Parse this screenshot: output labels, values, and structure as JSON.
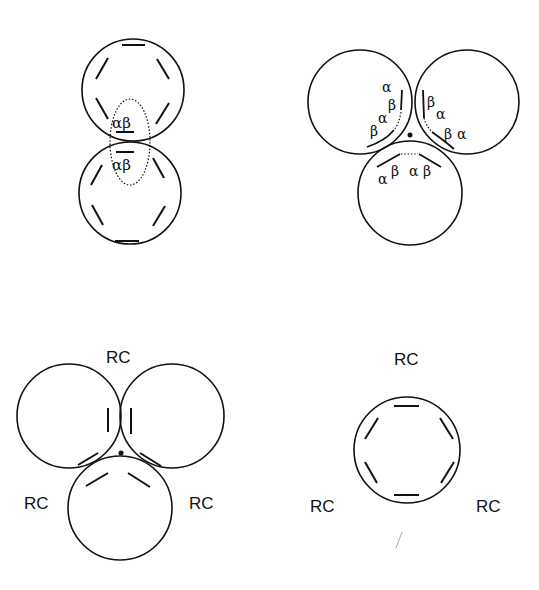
{
  "panels": {
    "dimer": {
      "name": "two-ring stacked dimer",
      "ellipse_label_top": "αβ",
      "ellipse_label_bottom": "αβ"
    },
    "trimer": {
      "name": "three-ring trimer with subunit labels",
      "left_labels": [
        "α",
        "β",
        "α",
        "β"
      ],
      "right_labels": [
        "β",
        "α",
        "β",
        "α"
      ],
      "bottom_labels": [
        "α",
        "β",
        "α",
        "β"
      ]
    },
    "rc_trimer": {
      "name": "three-ring trimer with reaction centers",
      "labels": {
        "top": "RC",
        "left": "RC",
        "right": "RC"
      }
    },
    "rc_ring": {
      "name": "single ring with reaction centers",
      "labels": {
        "top": "RC",
        "left": "RC",
        "right": "RC"
      }
    }
  },
  "colors": {
    "stroke": "#111111",
    "background": "#ffffff"
  }
}
